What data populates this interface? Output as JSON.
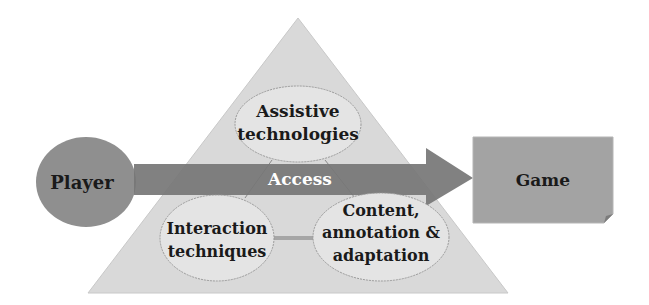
{
  "diagram": {
    "type": "accessibility-framework",
    "player": {
      "label": "Player"
    },
    "arrow": {
      "label": "Access"
    },
    "game": {
      "label": "Game"
    },
    "triangle_nodes": [
      {
        "id": "assistive",
        "lines": [
          "Assistive",
          "technologies"
        ]
      },
      {
        "id": "interaction",
        "lines": [
          "Interaction",
          "techniques"
        ]
      },
      {
        "id": "content",
        "lines": [
          "Content,",
          "annotation &",
          "adaptation"
        ]
      }
    ],
    "colors": {
      "triangle_fill": "#d9d9d9",
      "node_fill": "#e4e4e4",
      "node_stroke": "#9a9a9a",
      "player_fill": "#8f8f8f",
      "arrow_fill": "#7a7a7a",
      "game_fill": "#a3a3a3",
      "connector": "#a6a6a6"
    }
  }
}
